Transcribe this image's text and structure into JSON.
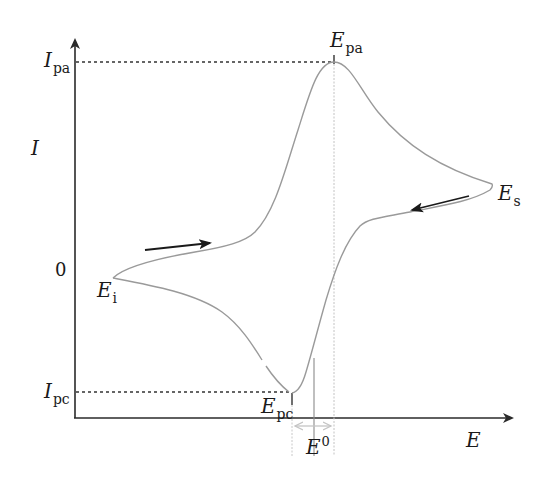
{
  "diagram": {
    "type": "cyclic-voltammogram",
    "axes": {
      "y_label": "I",
      "x_label": "E",
      "y_zero_label": "0"
    },
    "y_markers": [
      {
        "id": "ipa",
        "main": "I",
        "sub": "pa"
      },
      {
        "id": "ipc",
        "main": "I",
        "sub": "pc"
      }
    ],
    "x_markers": [
      {
        "id": "epa",
        "main": "E",
        "sub": "pa"
      },
      {
        "id": "epc",
        "main": "E",
        "sub": "pc"
      },
      {
        "id": "e0",
        "main": "E",
        "sup": "0"
      }
    ],
    "points": [
      {
        "id": "ei",
        "main": "E",
        "sub": "i"
      },
      {
        "id": "es",
        "main": "E",
        "sub": "s"
      }
    ],
    "scan_arrows": [
      {
        "id": "forward",
        "direction": "right"
      },
      {
        "id": "reverse",
        "direction": "left"
      }
    ],
    "colors": {
      "axis": "#2a2a2a",
      "curve": "#9a9a9a",
      "guide": "#bdbdbd",
      "dashed": "#333333",
      "delta_arrow": "#c8c8c8"
    }
  }
}
